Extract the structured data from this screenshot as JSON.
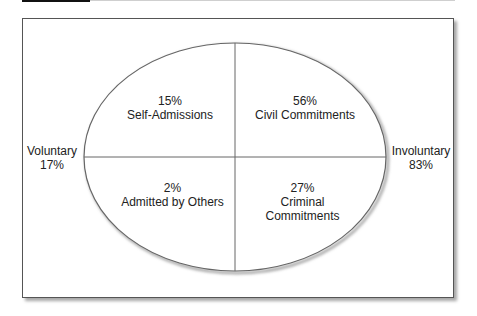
{
  "diagram": {
    "type": "quadrant-ellipse",
    "quadrants": [
      {
        "position": "top-left",
        "percent": "15%",
        "label": "Self-Admissions"
      },
      {
        "position": "top-right",
        "percent": "56%",
        "label": "Civil Commitments"
      },
      {
        "position": "bottom-left",
        "percent": "2%",
        "label": "Admitted by Others"
      },
      {
        "position": "bottom-right",
        "percent": "27%",
        "label_line1": "Criminal",
        "label_line2": "Commitments"
      }
    ],
    "sides": {
      "left": {
        "label": "Voluntary",
        "percent": "17%"
      },
      "right": {
        "label": "Involuntary",
        "percent": "83%"
      }
    }
  }
}
